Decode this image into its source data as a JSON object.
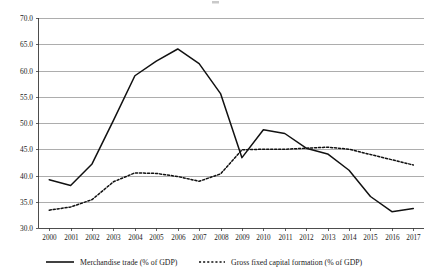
{
  "chart_data": {
    "type": "line",
    "title": "",
    "subtitle": "",
    "xlabel": "",
    "ylabel": "",
    "x": [
      2000,
      2001,
      2002,
      2003,
      2004,
      2005,
      2006,
      2007,
      2008,
      2009,
      2010,
      2011,
      2012,
      2013,
      2014,
      2015,
      2016,
      2017
    ],
    "categories": [
      "2000",
      "2001",
      "2002",
      "2003",
      "2004",
      "2005",
      "2006",
      "2007",
      "2008",
      "2009",
      "2010",
      "2011",
      "2012",
      "2013",
      "2014",
      "2015",
      "2016",
      "2017"
    ],
    "series": [
      {
        "name": "Merchandise trade (% of GDP)",
        "style": "solid",
        "color": "#111111",
        "values": [
          39.2,
          38.1,
          42.2,
          50.5,
          59.0,
          61.8,
          64.1,
          61.3,
          55.6,
          43.4,
          48.7,
          48.0,
          45.2,
          44.1,
          41.0,
          36.0,
          33.1,
          33.7
        ]
      },
      {
        "name": "Gross fixed capital formation (% of GDP)",
        "style": "dotted",
        "color": "#111111",
        "values": [
          33.4,
          34.0,
          35.4,
          38.8,
          40.5,
          40.4,
          39.8,
          38.9,
          40.3,
          44.9,
          45.0,
          45.0,
          45.2,
          45.4,
          45.0,
          44.0,
          43.0,
          42.0
        ]
      }
    ],
    "ylim": [
      30.0,
      70.0
    ],
    "ytick_values": [
      30.0,
      35.0,
      40.0,
      45.0,
      50.0,
      55.0,
      60.0,
      65.0,
      70.0
    ],
    "ytick_labels": [
      "30.0",
      "35.0",
      "40.0",
      "45.0",
      "50.0",
      "55.0",
      "60.0",
      "65.0",
      "70.0"
    ],
    "grid": true,
    "grid_axis": "y",
    "legend_position": "bottom",
    "legend": [
      "Merchandise trade (% of GDP)",
      "Gross fixed capital formation (% of GDP)"
    ]
  },
  "colors": {
    "series_line": "#111111",
    "gridline": "#8a8a8a",
    "axis": "#3a3a3a",
    "background": "#ffffff",
    "text": "#1a1a1a"
  }
}
